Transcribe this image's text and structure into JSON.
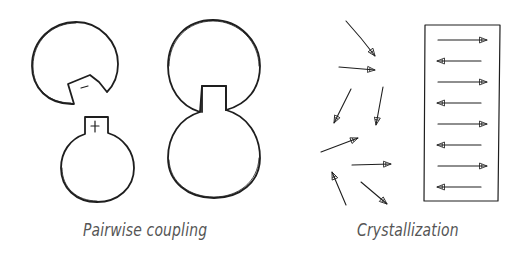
{
  "panels": [
    {
      "id": "pairwise-coupling",
      "caption": "Pairwise coupling",
      "elements": {
        "separated_pair": {
          "hatched_shape_notch_label": "−",
          "plain_shape_knob_label": "+"
        },
        "coupled_pair": {
          "description": "hatched shape joined with plain shape via knob"
        }
      }
    },
    {
      "id": "crystallization",
      "caption": "Crystallization",
      "elements": {
        "random_arrows_count": 9,
        "aligned_box_arrows": [
          "right",
          "left",
          "right",
          "left",
          "right",
          "left",
          "right",
          "left"
        ]
      }
    }
  ],
  "colors": {
    "ink": "#1e1e1e",
    "caption": "#555555",
    "background": "#ffffff"
  }
}
